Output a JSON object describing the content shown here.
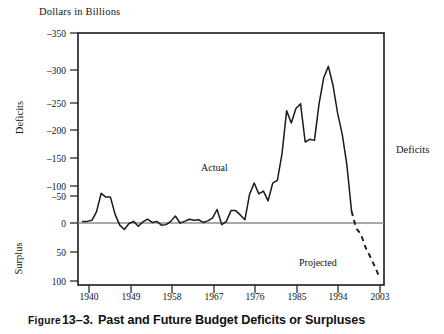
{
  "figure": {
    "caption_label": "Figure",
    "caption_number": "13–3.",
    "caption_text": "Past and Future Budget Deficits or Surpluses"
  },
  "labels": {
    "y_axis_title": "Dollars in Billions",
    "left_upper": "Deficits",
    "left_lower": "Surplus",
    "right": "Deficits",
    "annot_actual": "Actual",
    "annot_projected": "Projected"
  },
  "colors": {
    "line": "#1a1a1a",
    "frame": "#1a1a1a",
    "zero_line": "#8c8c8c",
    "text": "#141414",
    "background": "#ffffff"
  },
  "chart_data": {
    "type": "line",
    "title": "Past and Future Budget Deficits or Surpluses",
    "subtitle": "Dollars in Billions",
    "xlabel": "",
    "ylabel": "Dollars in Billions",
    "grid": false,
    "legend": "inline annotations",
    "y_axis_inverted": true,
    "ylim": [
      -375,
      115
    ],
    "xlim": [
      1938,
      2004
    ],
    "ytick_labels": [
      "–350",
      "–300",
      "–250",
      "–200",
      "–150",
      "–100",
      "–50",
      "0",
      "50",
      "100"
    ],
    "ytick_values": [
      -350,
      -300,
      -250,
      -200,
      -150,
      -100,
      -50,
      0,
      50,
      100
    ],
    "xtick_labels": [
      "1940",
      "1949",
      "1958",
      "1967",
      "1976",
      "1985",
      "1994",
      "2003"
    ],
    "xtick_values": [
      1940,
      1949,
      1958,
      1967,
      1976,
      1985,
      1994,
      2003
    ],
    "reference_lines": [
      {
        "axis": "y",
        "value": 0,
        "style": "solid",
        "color": "#8c8c8c"
      }
    ],
    "annotations": [
      {
        "text": "Actual",
        "x": 1971,
        "y": -95
      },
      {
        "text": "Projected",
        "x": 1996,
        "y": 63
      }
    ],
    "series": [
      {
        "name": "Actual",
        "style": "solid",
        "x": [
          1939,
          1940,
          1941,
          1942,
          1943,
          1944,
          1945,
          1946,
          1947,
          1948,
          1949,
          1950,
          1951,
          1952,
          1953,
          1954,
          1955,
          1956,
          1957,
          1958,
          1959,
          1960,
          1961,
          1962,
          1963,
          1964,
          1965,
          1966,
          1967,
          1968,
          1969,
          1970,
          1971,
          1972,
          1973,
          1974,
          1975,
          1976,
          1977,
          1978,
          1979,
          1980,
          1981,
          1982,
          1983,
          1984,
          1985,
          1986,
          1987,
          1988,
          1989,
          1990,
          1991,
          1992,
          1993,
          1994,
          1995,
          1996,
          1997
        ],
        "y": [
          -3,
          -3,
          -5,
          -21,
          -55,
          -48,
          -48,
          -16,
          4,
          12,
          1,
          -3,
          6,
          -2,
          -7,
          -1,
          -3,
          4,
          3,
          -3,
          -13,
          0,
          -3,
          -7,
          -5,
          -6,
          -1,
          -4,
          -9,
          -25,
          3,
          -3,
          -23,
          -23,
          -15,
          -6,
          -53,
          -74,
          -54,
          -59,
          -41,
          -74,
          -79,
          -128,
          -208,
          -185,
          -212,
          -221,
          -150,
          -155,
          -153,
          -221,
          -269,
          -290,
          -255,
          -203,
          -164,
          -107,
          -22
        ]
      },
      {
        "name": "Projected",
        "style": "dashed",
        "x": [
          1997,
          1998,
          1999,
          2000,
          2001,
          2002,
          2003
        ],
        "y": [
          -22,
          10,
          20,
          45,
          62,
          80,
          100
        ]
      }
    ]
  },
  "geometry": {
    "plot_left": 78,
    "plot_right": 384,
    "plot_top": 33,
    "plot_bottom": 285,
    "zero_y": 223
  }
}
